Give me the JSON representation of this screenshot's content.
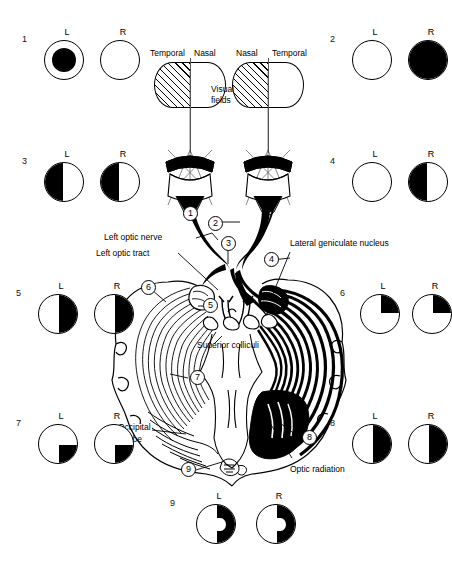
{
  "figure": {
    "type": "anatomical-diagram"
  },
  "visual_fields": {
    "caption": "Visual\nfields",
    "caption_line1": "Visual",
    "caption_line2": "fields",
    "left_eye": {
      "outer_label": "Temporal",
      "inner_label": "Nasal"
    },
    "right_eye": {
      "inner_label": "Nasal",
      "outer_label": "Temporal"
    }
  },
  "structures": [
    {
      "id": "left-optic-nerve",
      "label": "Left optic nerve"
    },
    {
      "id": "left-optic-tract",
      "label": "Left optic tract"
    },
    {
      "id": "lateral-geniculate-nucleus",
      "label": "Lateral geniculate nucleus"
    },
    {
      "id": "superior-colliculi",
      "label": "Superior colliculi"
    },
    {
      "id": "occipital-lobe",
      "label": "Occipital\nlobe",
      "line1": "Occipital",
      "line2": "lobe"
    },
    {
      "id": "optic-radiation",
      "label": "Optic radiation"
    }
  ],
  "lesion_markers": [
    "1",
    "2",
    "3",
    "4",
    "5",
    "6",
    "7",
    "8",
    "9"
  ],
  "eye_labels": {
    "left": "L",
    "right": "R"
  },
  "defects": [
    {
      "number": "1",
      "name": "central-scotoma-left-eye",
      "left": {
        "pattern": "central-scotoma"
      },
      "right": {
        "pattern": "normal"
      }
    },
    {
      "number": "2",
      "name": "total-blindness-right-eye",
      "left": {
        "pattern": "normal"
      },
      "right": {
        "pattern": "total"
      }
    },
    {
      "number": "3",
      "name": "bitemporal-hemianopia",
      "left": {
        "pattern": "half-left"
      },
      "right": {
        "pattern": "half-left"
      }
    },
    {
      "number": "4",
      "name": "nasal-hemianopia-right-eye",
      "left": {
        "pattern": "normal"
      },
      "right": {
        "pattern": "half-left"
      }
    },
    {
      "number": "5",
      "name": "right-homonymous-hemianopia",
      "left": {
        "pattern": "half-right"
      },
      "right": {
        "pattern": "half-right"
      }
    },
    {
      "number": "6",
      "name": "right-upper-quadrantanopia",
      "left": {
        "pattern": "quadrant-upper-right"
      },
      "right": {
        "pattern": "quadrant-upper-right"
      }
    },
    {
      "number": "7",
      "name": "right-lower-quadrantanopia",
      "left": {
        "pattern": "quadrant-lower-right"
      },
      "right": {
        "pattern": "quadrant-lower-right"
      }
    },
    {
      "number": "8",
      "name": "right-homonymous-hemianopia-congruous",
      "left": {
        "pattern": "half-right"
      },
      "right": {
        "pattern": "half-right"
      }
    },
    {
      "number": "9",
      "name": "right-homonymous-hemianopia-macular-sparing",
      "left": {
        "pattern": "half-right-macular-sparing"
      },
      "right": {
        "pattern": "half-right-macular-sparing"
      }
    }
  ],
  "colors": {
    "ink": "#000000",
    "paper": "#ffffff",
    "ray": "#555555"
  }
}
